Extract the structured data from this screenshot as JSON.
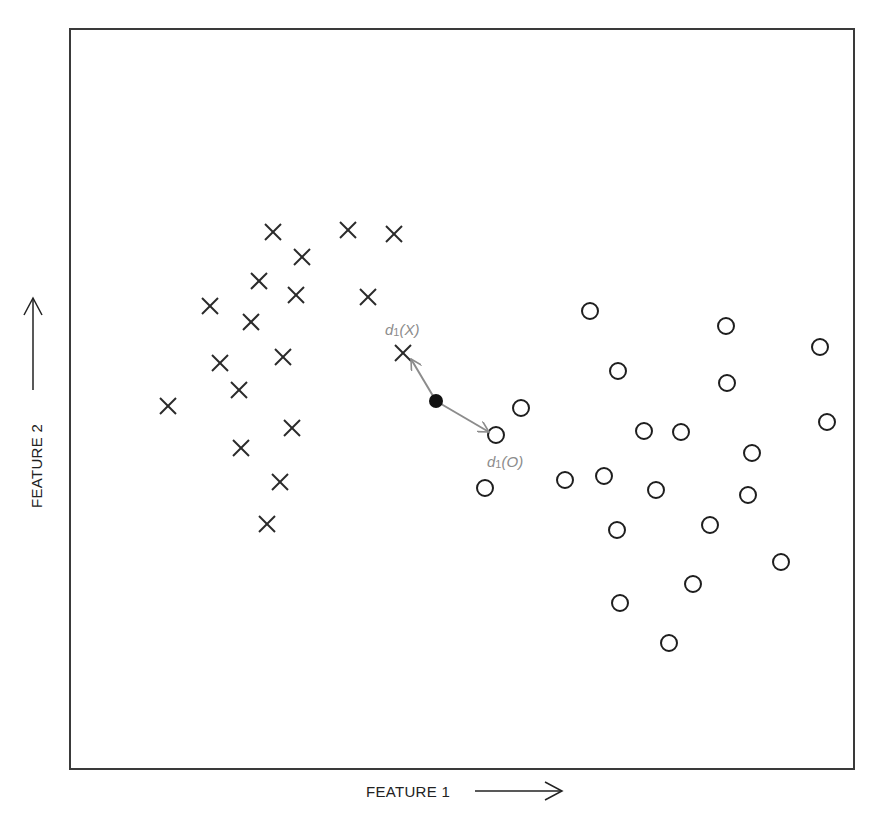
{
  "chart_data": {
    "type": "scatter",
    "title": "",
    "xlabel": "FEATURE 1",
    "ylabel": "FEATURE 2",
    "grid": false,
    "legend": null,
    "axis_ticks": "none",
    "frame_px": {
      "left": 70,
      "top": 29,
      "right": 854,
      "bottom": 769
    },
    "series": [
      {
        "name": "X",
        "marker": "x",
        "points_px": [
          [
            273,
            232
          ],
          [
            348,
            230
          ],
          [
            394,
            234
          ],
          [
            302,
            257
          ],
          [
            259,
            281
          ],
          [
            296,
            295
          ],
          [
            368,
            297
          ],
          [
            210,
            306
          ],
          [
            251,
            322
          ],
          [
            283,
            357
          ],
          [
            220,
            363
          ],
          [
            403,
            353
          ],
          [
            239,
            390
          ],
          [
            168,
            406
          ],
          [
            292,
            428
          ],
          [
            241,
            448
          ],
          [
            280,
            482
          ],
          [
            267,
            524
          ]
        ]
      },
      {
        "name": "O",
        "marker": "o",
        "points_px": [
          [
            590,
            311
          ],
          [
            726,
            326
          ],
          [
            820,
            347
          ],
          [
            618,
            371
          ],
          [
            727,
            383
          ],
          [
            521,
            408
          ],
          [
            827,
            422
          ],
          [
            496,
            435
          ],
          [
            644,
            431
          ],
          [
            681,
            432
          ],
          [
            752,
            453
          ],
          [
            485,
            488
          ],
          [
            565,
            480
          ],
          [
            604,
            476
          ],
          [
            656,
            490
          ],
          [
            748,
            495
          ],
          [
            617,
            530
          ],
          [
            710,
            525
          ],
          [
            781,
            562
          ],
          [
            693,
            584
          ],
          [
            620,
            603
          ],
          [
            669,
            643
          ]
        ]
      }
    ],
    "query_point_px": [
      436,
      401
    ],
    "annotations": [
      {
        "type": "arrow",
        "from_px": [
          436,
          401
        ],
        "to_px": [
          410,
          358
        ],
        "label": "d1(X)",
        "label_px": [
          385,
          335
        ],
        "color": "#8c8c8c"
      },
      {
        "type": "arrow",
        "from_px": [
          436,
          401
        ],
        "to_px": [
          490,
          432
        ],
        "label": "d1(O)",
        "label_px": [
          487,
          467
        ],
        "color": "#8c8c8c"
      }
    ]
  },
  "labels": {
    "x_axis": "FEATURE 1",
    "y_axis": "FEATURE 2",
    "d1x": {
      "d": "d",
      "sub": "1",
      "arg": "(X)"
    },
    "d1o": {
      "d": "d",
      "sub": "1",
      "arg": "(O)"
    }
  },
  "colors": {
    "frame": "#3a3a3a",
    "markers": "#1e1e1e",
    "annotation": "#8c8c8c",
    "query_point": "#111111"
  }
}
